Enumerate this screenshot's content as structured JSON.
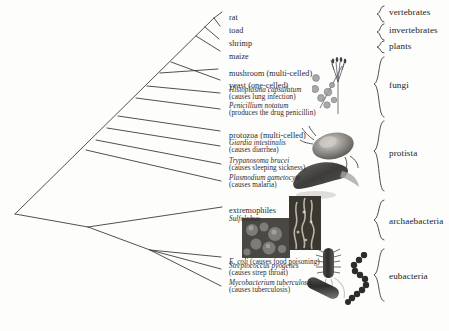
{
  "diagram": {
    "type": "phylogenetic-tree",
    "root_label": ""
  },
  "taxa": [
    {
      "id": "rat",
      "name": "rat",
      "sci": "",
      "note": "",
      "x": 229,
      "y": 11,
      "tip_x": 222,
      "tip_y": 14
    },
    {
      "id": "toad",
      "name": "toad",
      "sci": "",
      "note": "",
      "x": 229,
      "y": 24,
      "tip_x": 218,
      "tip_y": 27
    },
    {
      "id": "shrimp",
      "name": "shrimp",
      "sci": "",
      "note": "",
      "x": 229,
      "y": 37,
      "tip_x": 216,
      "tip_y": 40
    },
    {
      "id": "maize",
      "name": "maize",
      "sci": "",
      "note": "",
      "x": 229,
      "y": 50,
      "tip_x": 219,
      "tip_y": 52
    },
    {
      "id": "mushroom",
      "name": "mushroom (multi-celled)",
      "sci": "",
      "note": "",
      "x": 229,
      "y": 67,
      "tip_x": 216,
      "tip_y": 70
    },
    {
      "id": "yeast",
      "name": "yeast (one-celled)",
      "sci": "",
      "note": "",
      "x": 229,
      "y": 79,
      "tip_x": 218,
      "tip_y": 81
    },
    {
      "id": "histoplasma",
      "name": "",
      "sci": "Histoplasma capsulatum",
      "note": "(causes lung infection)",
      "x": 229,
      "y": 89,
      "tip_x": 219,
      "tip_y": 94
    },
    {
      "id": "penicillium",
      "name": "",
      "sci": "Penicillium notatum",
      "note": "(produces the drug penicillin)",
      "x": 229,
      "y": 105,
      "tip_x": 219,
      "tip_y": 110
    },
    {
      "id": "protozoa",
      "name": "protozoa (multi-celled)",
      "sci": "",
      "note": "",
      "x": 229,
      "y": 129,
      "tip_x": 216,
      "tip_y": 132
    },
    {
      "id": "giardia",
      "name": "",
      "sci": "Giardia intestinalis",
      "note": "(causes diarrhea)",
      "x": 229,
      "y": 142,
      "tip_x": 219,
      "tip_y": 147
    },
    {
      "id": "trypanosoma",
      "name": "",
      "sci": "Trypanosoma brucei",
      "note": "(causes sleeping sickness)",
      "x": 229,
      "y": 160,
      "tip_x": 219,
      "tip_y": 165
    },
    {
      "id": "plasmodium",
      "name": "",
      "sci": "Plasmodium gametocyte",
      "note": "(causes malaria)",
      "x": 229,
      "y": 177,
      "tip_x": 219,
      "tip_y": 182
    },
    {
      "id": "extremophiles",
      "name": "extremophiles",
      "sci": "Sulfolobus",
      "note": "",
      "x": 229,
      "y": 206,
      "tip_x": 216,
      "tip_y": 210
    },
    {
      "id": "ecoli",
      "name": "",
      "sci": "E. coli",
      "note": " (causes food poisoning)",
      "x": 229,
      "y": 255,
      "tip_x": 220,
      "tip_y": 258
    },
    {
      "id": "streptococcus",
      "name": "",
      "sci": "Streptococcus pyogenes",
      "note": "(causes strep throat)",
      "x": 229,
      "y": 266,
      "tip_x": 220,
      "tip_y": 270
    },
    {
      "id": "mycobacterium",
      "name": "",
      "sci": "Mycobacterium tuberculosis",
      "note": "(causes tuberculosis)",
      "x": 229,
      "y": 283,
      "tip_x": 220,
      "tip_y": 287
    }
  ],
  "kingdoms": [
    {
      "id": "vertebrates",
      "label": "vertebrates",
      "x": 395,
      "y": 12,
      "brace_top": 6,
      "brace_bottom": 22,
      "brace_x": 380
    },
    {
      "id": "invertebrates",
      "label": "invertebrates",
      "x": 395,
      "y": 29,
      "brace_top": 24,
      "brace_bottom": 40,
      "brace_x": 380
    },
    {
      "id": "plants",
      "label": "plants",
      "x": 395,
      "y": 45,
      "brace_top": 40,
      "brace_bottom": 54,
      "brace_x": 380
    },
    {
      "id": "fungi",
      "label": "fungi",
      "x": 395,
      "y": 84,
      "brace_top": 56,
      "brace_bottom": 118,
      "brace_x": 380
    },
    {
      "id": "protista",
      "label": "protista",
      "x": 395,
      "y": 152,
      "brace_top": 120,
      "brace_bottom": 192,
      "brace_x": 380
    },
    {
      "id": "archaebacteria",
      "label": "archaebacteria",
      "x": 395,
      "y": 222,
      "brace_top": 200,
      "brace_bottom": 240,
      "brace_x": 380
    },
    {
      "id": "eubacteria",
      "label": "eubacteria",
      "x": 395,
      "y": 277,
      "brace_top": 248,
      "brace_bottom": 302,
      "brace_x": 380
    }
  ],
  "tree": {
    "root": {
      "x": 15,
      "y": 214
    },
    "nodes": [
      {
        "id": "n-crown",
        "x": 214,
        "y": 18
      },
      {
        "id": "n-euk",
        "x": 160,
        "y": 73
      },
      {
        "id": "n-fungi",
        "x": 128,
        "y": 106
      },
      {
        "id": "n-protist",
        "x": 96,
        "y": 140
      },
      {
        "id": "n-bact-base",
        "x": 62,
        "y": 173
      },
      {
        "id": "n-archaea",
        "x": 88,
        "y": 227
      },
      {
        "id": "n-eub",
        "x": 150,
        "y": 250
      }
    ]
  },
  "illustrations": [
    {
      "id": "penicillium-spores",
      "caption": "penicillium conidiophore and spores"
    },
    {
      "id": "giardia-photo",
      "caption": "giardia micrograph"
    },
    {
      "id": "plasmodium-photo",
      "caption": "plasmodium gametocyte micrograph"
    },
    {
      "id": "sulfolobus-photo",
      "caption": "sulfolobus micrograph panel"
    },
    {
      "id": "hotspring-photo",
      "caption": "hot spring micrograph panel"
    },
    {
      "id": "ecoli-art",
      "caption": "flagellated rod bacterium"
    },
    {
      "id": "streptococcus-art",
      "caption": "chain of cocci"
    },
    {
      "id": "mycobacterium-art",
      "caption": "rod shaped bacillus"
    }
  ],
  "colors": {
    "background": "#fdfdfc",
    "ink": "#2a2a2e",
    "branch": "#3c3c40",
    "photo_dark": "#3a3a38"
  }
}
